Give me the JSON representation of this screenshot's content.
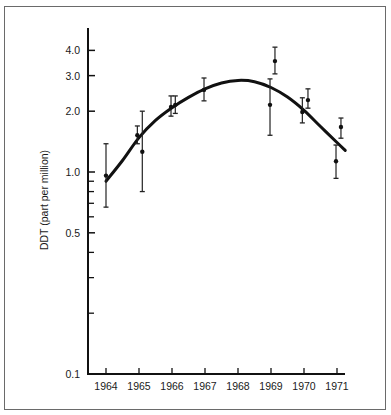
{
  "chart_data": {
    "type": "scatter",
    "title": "",
    "xlabel": "",
    "ylabel": "DDT (part per million)",
    "yscale": "log",
    "ylim": [
      0.1,
      4.5
    ],
    "xlim": [
      1963.5,
      1971.25
    ],
    "grid": false,
    "legend": null,
    "x_ticks": [
      "1964",
      "1965",
      "1966",
      "1967",
      "1968",
      "1969",
      "1970",
      "1971"
    ],
    "y_tick_labels": [
      "4.0",
      "3.0",
      "2.0",
      "1.0",
      "0.5",
      "0.1"
    ],
    "y_tick_values": [
      4.0,
      3.0,
      2.0,
      1.0,
      0.5,
      0.1
    ],
    "y_minor_ticks": [
      0.9,
      0.8,
      0.7,
      0.6,
      0.4,
      0.3,
      0.2
    ],
    "series": [
      {
        "name": "observations",
        "points": [
          {
            "x": 1964.0,
            "y": 0.96,
            "lo": 0.67,
            "hi": 1.38
          },
          {
            "x": 1964.95,
            "y": 1.52,
            "lo": 1.38,
            "hi": 1.69
          },
          {
            "x": 1965.1,
            "y": 1.26,
            "lo": 0.8,
            "hi": 2.0
          },
          {
            "x": 1965.97,
            "y": 2.1,
            "lo": 1.89,
            "hi": 2.38
          },
          {
            "x": 1966.1,
            "y": 2.15,
            "lo": 1.95,
            "hi": 2.38
          },
          {
            "x": 1966.97,
            "y": 2.55,
            "lo": 2.25,
            "hi": 2.92
          },
          {
            "x": 1968.97,
            "y": 2.15,
            "lo": 1.52,
            "hi": 2.89
          },
          {
            "x": 1969.12,
            "y": 3.54,
            "lo": 3.06,
            "hi": 4.15
          },
          {
            "x": 1969.95,
            "y": 1.98,
            "lo": 1.75,
            "hi": 2.33
          },
          {
            "x": 1970.12,
            "y": 2.27,
            "lo": 2.07,
            "hi": 2.58
          },
          {
            "x": 1970.97,
            "y": 1.13,
            "lo": 0.93,
            "hi": 1.36
          },
          {
            "x": 1971.12,
            "y": 1.67,
            "lo": 1.47,
            "hi": 1.85
          }
        ]
      },
      {
        "name": "fitted curve",
        "type": "line",
        "x": [
          1964.0,
          1964.5,
          1965.0,
          1965.5,
          1966.0,
          1966.5,
          1967.0,
          1967.5,
          1968.0,
          1968.5,
          1969.0,
          1969.5,
          1970.0,
          1970.5,
          1971.0,
          1971.25
        ],
        "y": [
          0.9,
          1.14,
          1.48,
          1.8,
          2.08,
          2.34,
          2.58,
          2.76,
          2.84,
          2.8,
          2.62,
          2.35,
          2.02,
          1.68,
          1.4,
          1.28
        ]
      }
    ]
  }
}
